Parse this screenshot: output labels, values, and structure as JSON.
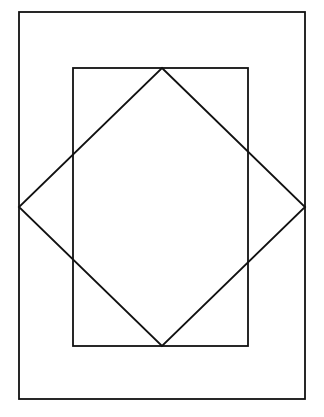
{
  "diagram": {
    "title": "",
    "shapes": [
      {
        "id": "outer-rectangle",
        "kind": "rectangle"
      },
      {
        "id": "inner-rectangle",
        "kind": "rectangle"
      },
      {
        "id": "diamond",
        "kind": "rotated-square"
      }
    ],
    "colors": {
      "stroke": "#111111",
      "background": "#ffffff"
    }
  }
}
